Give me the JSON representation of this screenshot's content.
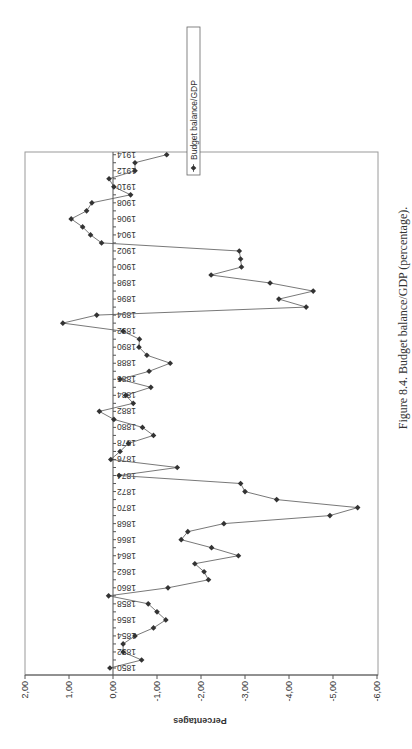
{
  "chart_data": {
    "type": "line",
    "orientation": "rotated 90 degrees clockwise (years run along vertical axis, values along horizontal axis, text upside down)",
    "title": "",
    "caption": "Figure 8.4.  Budget balance/GDP (percentage).",
    "xlabel": "",
    "ylabel": "Percentages",
    "ylim": [
      -6.0,
      2.0
    ],
    "value_ticks": [
      "2,00",
      "1,00",
      "0,00",
      "-1,00",
      "-2,00",
      "-3,00",
      "-4,00",
      "-5,00",
      "-6,00"
    ],
    "value_tick_values": [
      2,
      1,
      0,
      -1,
      -2,
      -3,
      -4,
      -5,
      -6
    ],
    "year_ticks": [
      "1850",
      "1852",
      "1854",
      "1856",
      "1858",
      "1860",
      "1862",
      "1864",
      "1866",
      "1868",
      "1870",
      "1872",
      "1874",
      "1876",
      "1878",
      "1880",
      "1882",
      "1884",
      "1886",
      "1888",
      "1890",
      "1892",
      "1894",
      "1896",
      "1898",
      "1900",
      "1902",
      "1904",
      "1906",
      "1908",
      "1910",
      "1912",
      "1914"
    ],
    "grid": false,
    "legend_position": "top-right (rotated)",
    "x": [
      1850,
      1851,
      1852,
      1853,
      1854,
      1855,
      1856,
      1857,
      1858,
      1859,
      1860,
      1861,
      1862,
      1863,
      1864,
      1865,
      1866,
      1867,
      1868,
      1869,
      1870,
      1871,
      1872,
      1873,
      1874,
      1875,
      1876,
      1877,
      1878,
      1879,
      1880,
      1881,
      1882,
      1883,
      1884,
      1885,
      1886,
      1887,
      1888,
      1889,
      1890,
      1891,
      1892,
      1893,
      1894,
      1895,
      1896,
      1897,
      1898,
      1899,
      1900,
      1901,
      1902,
      1903,
      1904,
      1905,
      1906,
      1907,
      1908,
      1909,
      1910,
      1911,
      1912,
      1913,
      1914
    ],
    "series": [
      {
        "name": "Budget balance/GDP",
        "marker": "diamond",
        "values": [
          0.07,
          -0.65,
          -0.23,
          -0.23,
          -0.5,
          -0.92,
          -1.2,
          -1.0,
          -0.8,
          0.1,
          -1.25,
          -2.17,
          -2.07,
          -1.86,
          -2.85,
          -2.24,
          -1.55,
          -1.7,
          -2.52,
          -4.93,
          -5.56,
          -3.72,
          -3.0,
          -2.9,
          -0.14,
          -1.46,
          0.05,
          -0.16,
          -0.35,
          -0.92,
          -0.67,
          -0.02,
          0.31,
          -0.46,
          -0.29,
          -0.86,
          -0.16,
          -0.82,
          -1.3,
          -0.77,
          -0.59,
          -0.6,
          -0.23,
          1.14,
          0.37,
          -4.39,
          -3.77,
          -4.55,
          -3.57,
          -2.23,
          -2.92,
          -2.9,
          -2.87,
          0.26,
          0.51,
          0.69,
          0.95,
          0.6,
          0.48,
          -0.4,
          -0.02,
          0.09,
          -0.5,
          -0.5,
          -1.22
        ]
      }
    ]
  },
  "legend": {
    "label": "Budget balance/GDP"
  },
  "axis": {
    "ylabel": "Percentages"
  },
  "caption": {
    "text": "Figure 8.4.  Budget balance/GDP (percentage)."
  }
}
